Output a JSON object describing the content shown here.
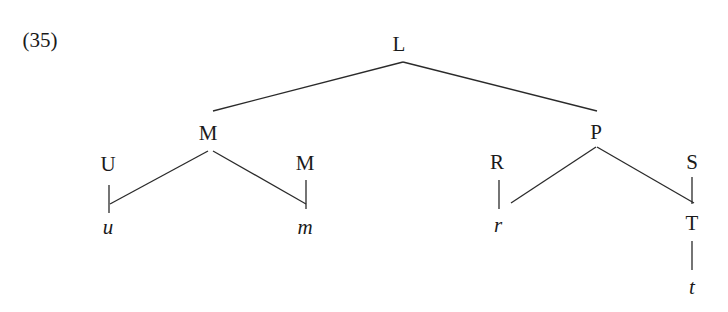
{
  "example_number": "(35)",
  "tree": {
    "nodes": [
      {
        "id": "L",
        "label": "L",
        "x": 399,
        "y": 44,
        "italic": false
      },
      {
        "id": "M1",
        "label": "M",
        "x": 208,
        "y": 133,
        "italic": false
      },
      {
        "id": "P",
        "label": "P",
        "x": 596,
        "y": 132,
        "italic": false
      },
      {
        "id": "U",
        "label": "U",
        "x": 108,
        "y": 164,
        "italic": false
      },
      {
        "id": "M2",
        "label": "M",
        "x": 305,
        "y": 163,
        "italic": false
      },
      {
        "id": "R",
        "label": "R",
        "x": 497,
        "y": 162,
        "italic": false
      },
      {
        "id": "S",
        "label": "S",
        "x": 692,
        "y": 162,
        "italic": false
      },
      {
        "id": "u",
        "label": "u",
        "x": 108,
        "y": 227,
        "italic": true
      },
      {
        "id": "m",
        "label": "m",
        "x": 305,
        "y": 227,
        "italic": true
      },
      {
        "id": "r",
        "label": "r",
        "x": 498,
        "y": 225,
        "italic": true
      },
      {
        "id": "T",
        "label": "T",
        "x": 692,
        "y": 223,
        "italic": false
      },
      {
        "id": "t",
        "label": "t",
        "x": 692,
        "y": 287,
        "italic": true
      }
    ],
    "edges": [
      {
        "from": "L",
        "to": "M1",
        "x1": 403,
        "y1": 62,
        "x2": 213,
        "y2": 111
      },
      {
        "from": "L",
        "to": "P",
        "x1": 403,
        "y1": 62,
        "x2": 597,
        "y2": 111
      },
      {
        "from": "M1",
        "to": "U",
        "x1": 208,
        "y1": 151,
        "x2": 110,
        "y2": 204
      },
      {
        "from": "M1",
        "to": "M2",
        "x1": 213,
        "y1": 151,
        "x2": 306,
        "y2": 204
      },
      {
        "from": "P",
        "to": "R",
        "x1": 596,
        "y1": 147,
        "x2": 511,
        "y2": 203
      },
      {
        "from": "P",
        "to": "S",
        "x1": 597,
        "y1": 147,
        "x2": 694,
        "y2": 203
      },
      {
        "from": "U",
        "to": "u",
        "x1": 109,
        "y1": 185,
        "x2": 109,
        "y2": 213
      },
      {
        "from": "M2",
        "to": "m",
        "x1": 306,
        "y1": 180,
        "x2": 306,
        "y2": 209
      },
      {
        "from": "R",
        "to": "r",
        "x1": 499,
        "y1": 180,
        "x2": 499,
        "y2": 209
      },
      {
        "from": "S",
        "to": "T",
        "x1": 692,
        "y1": 177,
        "x2": 692,
        "y2": 204
      },
      {
        "from": "T",
        "to": "t",
        "x1": 692,
        "y1": 241,
        "x2": 692,
        "y2": 270
      }
    ]
  }
}
